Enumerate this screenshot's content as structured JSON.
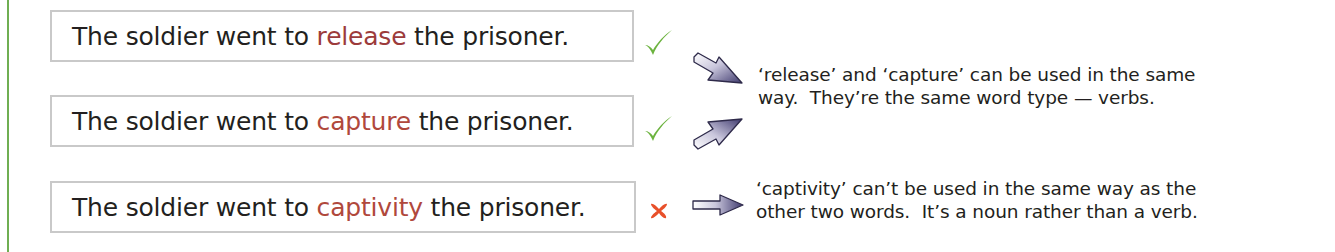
{
  "colors": {
    "accent_rule": "#6fae52",
    "highlight_release": "#9c3b3b",
    "highlight_capture": "#b0483c",
    "highlight_captivity": "#b0483c",
    "check": "#6cb33f",
    "cross": "#e8502a",
    "arrow": "#4b4678"
  },
  "sentences": [
    {
      "before": "The soldier went to ",
      "word": "release",
      "after": " the prisoner.",
      "mark": "check-icon",
      "valid": true
    },
    {
      "before": "The soldier went to ",
      "word": "capture",
      "after": " the prisoner.",
      "mark": "check-icon",
      "valid": true
    },
    {
      "before": "The soldier went to ",
      "word": "captivity",
      "after": " the prisoner.",
      "mark": "cross-icon",
      "valid": false
    }
  ],
  "explanations": [
    {
      "line1": "‘release’ and ‘capture’ can be used in the same",
      "line2": "way.  They’re the same word type — verbs."
    },
    {
      "line1": "‘captivity’ can’t be used in the same way as the",
      "line2": "other two words.  It’s a noun rather than a verb."
    }
  ]
}
